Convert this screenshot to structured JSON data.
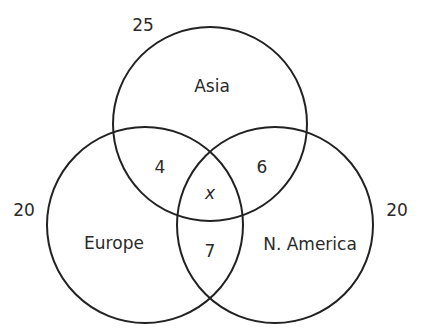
{
  "diagram": {
    "type": "venn",
    "sets": [
      {
        "id": "asia",
        "label": "Asia",
        "total": "25"
      },
      {
        "id": "europe",
        "label": "Europe",
        "total": "20"
      },
      {
        "id": "namerica",
        "label": "N. America",
        "total": "20"
      }
    ],
    "regions": {
      "asia_europe": "4",
      "asia_namerica": "6",
      "europe_namerica": "7",
      "all_three": "x"
    },
    "stroke_color": "#222222",
    "text_color": "#2a2a2a"
  }
}
